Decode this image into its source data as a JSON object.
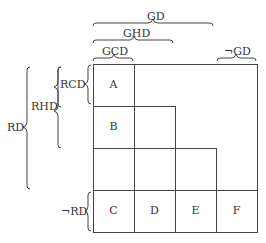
{
  "top_labels": {
    "gd": "GD",
    "ghd": "GHD",
    "gcd": "GCD",
    "not_gd": "¬GD"
  },
  "left_labels": {
    "rd": "RD",
    "rhd": "RHD",
    "rcd": "RCD",
    "not_rd": "¬RD"
  },
  "cells": {
    "a": "A",
    "b": "B",
    "c": "C",
    "d": "D",
    "e": "E",
    "f": "F"
  }
}
